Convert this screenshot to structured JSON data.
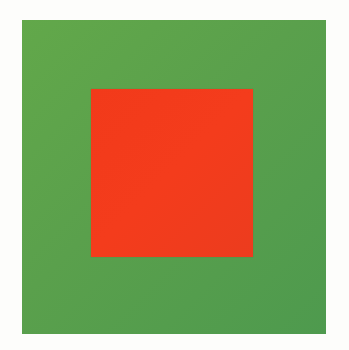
{
  "image": {
    "description": "Color study: red-orange square centered on a green square on white background",
    "background_color": "#fdfdfb",
    "outer_square": {
      "color": "#5aa04c",
      "bounds": {
        "x": 22,
        "y": 20,
        "width": 304,
        "height": 314
      }
    },
    "inner_square": {
      "color": "#f23a1a",
      "bounds": {
        "x": 91,
        "y": 89,
        "width": 162,
        "height": 168
      }
    }
  }
}
